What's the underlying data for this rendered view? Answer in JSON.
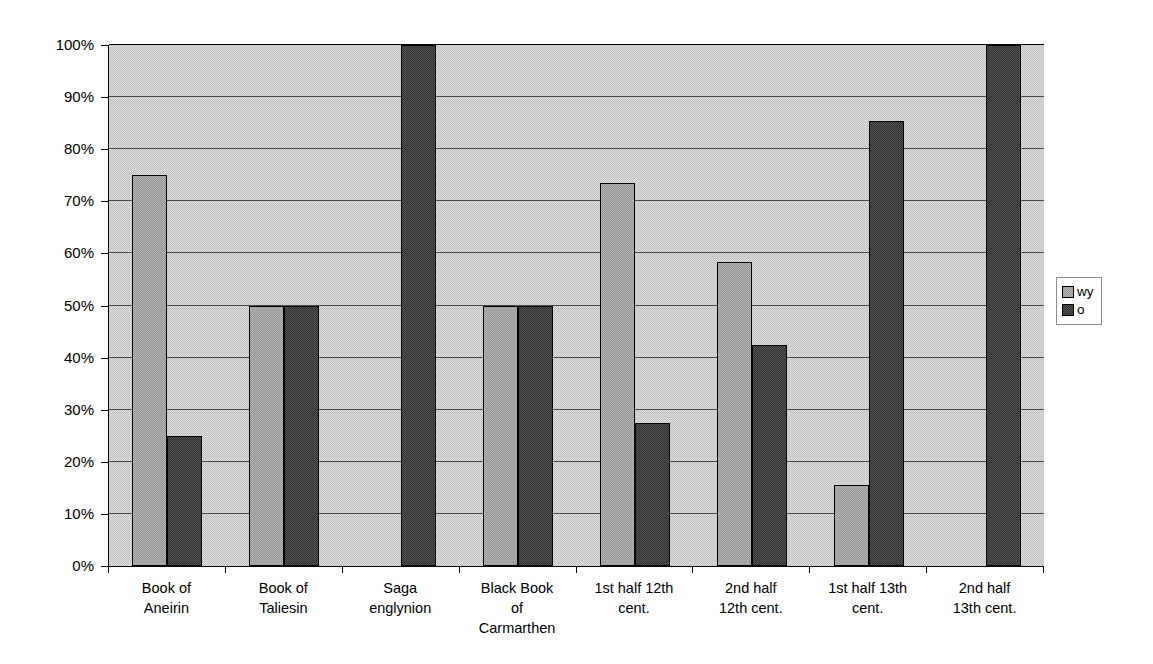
{
  "chart_data": {
    "type": "bar",
    "title": "",
    "subtitle": "",
    "xlabel": "",
    "ylabel": "",
    "categories": [
      "Book of\nAneirin",
      "Book of\nTaliesin",
      "Saga\nenglynion",
      "Black Book\nof\nCarmarthen",
      "1st half 12th\ncent.",
      "2nd half\n12th cent.",
      "1st half 13th\ncent.",
      "2nd half\n13th cent."
    ],
    "series": [
      {
        "name": "wy",
        "color": "#9a9a9a",
        "values": [
          75,
          50,
          0,
          50,
          73.5,
          58.3,
          15.5,
          0
        ]
      },
      {
        "name": "o",
        "color": "#333333",
        "values": [
          25,
          50,
          100,
          50,
          27.5,
          42.5,
          85.5,
          100
        ]
      }
    ],
    "ylim": [
      0,
      100
    ],
    "ytick_values": [
      0,
      10,
      20,
      30,
      40,
      50,
      60,
      70,
      80,
      90,
      100
    ],
    "ytick_labels": [
      "0%",
      "10%",
      "20%",
      "30%",
      "40%",
      "50%",
      "60%",
      "70%",
      "80%",
      "90%",
      "100%"
    ],
    "grid": true,
    "legend_position": "right",
    "plot_background": "#c3c3c3"
  },
  "legend": {
    "items": [
      {
        "label": "wy",
        "swatch": "legend-swatch-wy"
      },
      {
        "label": "o",
        "swatch": "legend-swatch-o"
      }
    ]
  }
}
